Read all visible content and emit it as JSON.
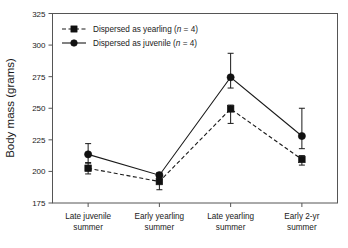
{
  "chart_data": {
    "type": "line",
    "title": "",
    "xlabel": "",
    "ylabel": "Body mass (grams)",
    "ylim": [
      175,
      325
    ],
    "yticks": [
      175,
      200,
      225,
      250,
      275,
      300,
      325
    ],
    "ytick_labels": [
      "175",
      "200",
      "225",
      "250",
      "275",
      "300",
      "325"
    ],
    "grid": false,
    "legend_position": "top-left",
    "categories": [
      "Late juvenile summer",
      "Early yearling summer",
      "Late yearling summer",
      "Early 2-yr summer"
    ],
    "category_lines": [
      [
        "Late juvenile",
        "summer"
      ],
      [
        "Early yearling",
        "summer"
      ],
      [
        "Late yearling",
        "summer"
      ],
      [
        "Early 2-yr",
        "summer"
      ]
    ],
    "series": [
      {
        "name": "Dispersed as yearling (n = 4)",
        "label_prefix": "Dispersed as yearling (",
        "label_italic": "n",
        "label_suffix": " = 4)",
        "marker": "square",
        "linestyle": "dashed",
        "color": "#111111",
        "values": [
          202.5,
          192.0,
          249.5,
          209.5
        ],
        "err_low": [
          4.5,
          6.5,
          11.5,
          4.5
        ],
        "err_high": [
          4.5,
          1.5,
          3.0,
          3.0
        ]
      },
      {
        "name": "Dispersed as juvenile (n = 4)",
        "label_prefix": "Dispersed as juvenile (",
        "label_italic": "n",
        "label_suffix": " = 4)",
        "marker": "circle",
        "linestyle": "solid",
        "color": "#111111",
        "values": [
          213.5,
          197.0,
          274.5,
          228.0
        ],
        "err_low": [
          7.0,
          2.0,
          8.5,
          10.0
        ],
        "err_high": [
          8.5,
          2.0,
          19.0,
          22.0
        ]
      }
    ]
  }
}
